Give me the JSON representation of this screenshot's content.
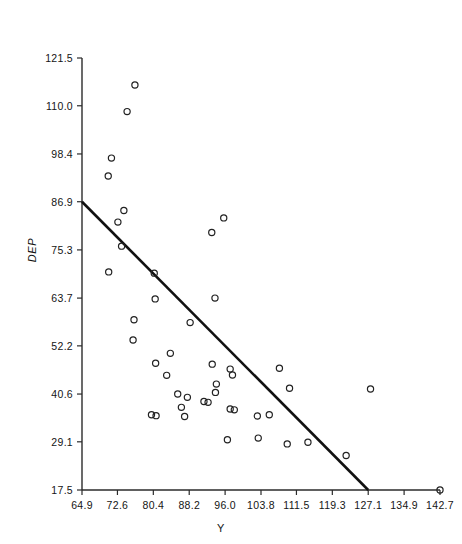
{
  "chart_data": {
    "type": "scatter",
    "title": "",
    "xlabel": "Y",
    "ylabel": "DEP",
    "xlim": [
      64.9,
      142.7
    ],
    "ylim": [
      17.5,
      121.5
    ],
    "grid": false,
    "legend": "none",
    "x_ticks": [
      "64.9",
      "72.6",
      "80.4",
      "88.2",
      "96.0",
      "103.8",
      "111.5",
      "119.3",
      "127.1",
      "134.9",
      "142.7"
    ],
    "x_tick_values": [
      64.9,
      72.6,
      80.4,
      88.2,
      96.0,
      103.8,
      111.5,
      119.3,
      127.1,
      134.9,
      142.7
    ],
    "y_ticks": [
      "17.5",
      "29.1",
      "40.6",
      "52.2",
      "63.7",
      "75.3",
      "86.9",
      "98.4",
      "110.0",
      "121.5"
    ],
    "y_tick_values": [
      17.5,
      29.1,
      40.6,
      52.2,
      63.7,
      75.3,
      86.9,
      98.4,
      110.0,
      121.5
    ],
    "marker": "open-circle",
    "marker_color": "#222222",
    "points": [
      {
        "x": 76.4,
        "y": 115.0
      },
      {
        "x": 74.7,
        "y": 108.6
      },
      {
        "x": 71.3,
        "y": 97.4
      },
      {
        "x": 70.6,
        "y": 93.1
      },
      {
        "x": 74.0,
        "y": 84.8
      },
      {
        "x": 72.7,
        "y": 82.0
      },
      {
        "x": 73.5,
        "y": 76.2
      },
      {
        "x": 95.7,
        "y": 83.0
      },
      {
        "x": 93.1,
        "y": 79.5
      },
      {
        "x": 70.7,
        "y": 70.0
      },
      {
        "x": 80.6,
        "y": 69.7
      },
      {
        "x": 80.8,
        "y": 63.5
      },
      {
        "x": 93.8,
        "y": 63.7
      },
      {
        "x": 76.2,
        "y": 58.5
      },
      {
        "x": 88.4,
        "y": 57.8
      },
      {
        "x": 76.0,
        "y": 53.6
      },
      {
        "x": 84.1,
        "y": 50.4
      },
      {
        "x": 80.9,
        "y": 48.0
      },
      {
        "x": 93.2,
        "y": 47.8
      },
      {
        "x": 97.1,
        "y": 46.6
      },
      {
        "x": 97.6,
        "y": 45.2
      },
      {
        "x": 83.3,
        "y": 45.1
      },
      {
        "x": 107.8,
        "y": 46.8
      },
      {
        "x": 127.6,
        "y": 41.8
      },
      {
        "x": 94.1,
        "y": 43.0
      },
      {
        "x": 93.9,
        "y": 41.0
      },
      {
        "x": 110.0,
        "y": 42.0
      },
      {
        "x": 85.7,
        "y": 40.6
      },
      {
        "x": 87.8,
        "y": 39.8
      },
      {
        "x": 91.4,
        "y": 38.8
      },
      {
        "x": 92.3,
        "y": 38.6
      },
      {
        "x": 86.5,
        "y": 37.4
      },
      {
        "x": 97.1,
        "y": 37.0
      },
      {
        "x": 98.0,
        "y": 36.8
      },
      {
        "x": 80.0,
        "y": 35.6
      },
      {
        "x": 81.0,
        "y": 35.4
      },
      {
        "x": 87.2,
        "y": 35.2
      },
      {
        "x": 103.0,
        "y": 35.3
      },
      {
        "x": 105.6,
        "y": 35.6
      },
      {
        "x": 96.5,
        "y": 29.6
      },
      {
        "x": 103.2,
        "y": 30.0
      },
      {
        "x": 109.5,
        "y": 28.6
      },
      {
        "x": 114.0,
        "y": 29.0
      },
      {
        "x": 122.3,
        "y": 25.8
      },
      {
        "x": 142.7,
        "y": 17.5
      }
    ],
    "fit_line": {
      "label": "regression-line",
      "x_start": 64.9,
      "y_start": 86.9,
      "x_end": 127.1,
      "y_end": 17.5,
      "color": "#111111"
    }
  }
}
